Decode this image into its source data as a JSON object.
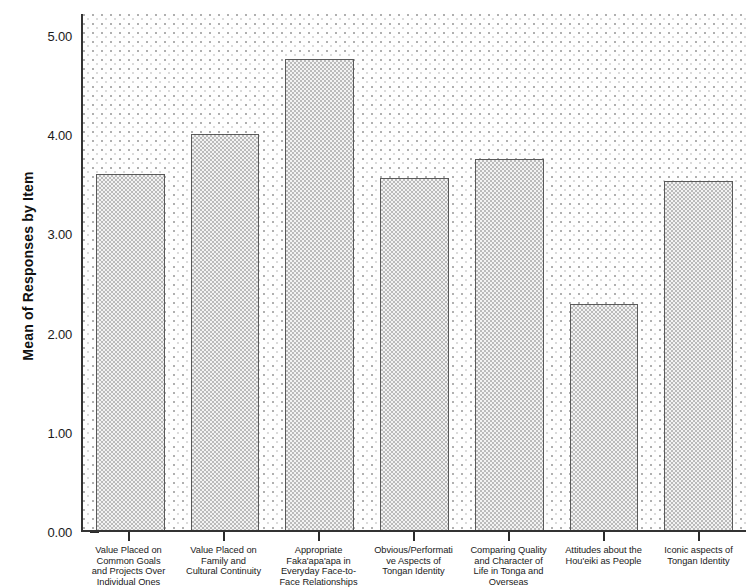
{
  "chart_data": {
    "type": "bar",
    "title": "",
    "subtitle": "",
    "xlabel": "",
    "ylabel": "Mean of Responses by Item",
    "ylim": [
      0.0,
      5.22
    ],
    "yticks": [
      "0.00",
      "1.00",
      "2.00",
      "3.00",
      "4.00",
      "5.00"
    ],
    "ytick_values": [
      0.0,
      1.0,
      2.0,
      3.0,
      4.0,
      5.0
    ],
    "grid": false,
    "legend": null,
    "categories": [
      "Value Placed on Common Goals and Projects Over Individual Ones",
      "Value Placed on Family and Cultural Continuity",
      "Appropriate Faka'apa'apa in Everyday Face-to-Face Relationships",
      "Obvious/Performative Aspects of Tongan Identity",
      "Comparing Quality and Character of Life in Tonga and Overseas",
      "Attitudes about the Hou'eiki as People",
      "Iconic aspects of Tongan Identity"
    ],
    "category_lines": [
      [
        "Value Placed on",
        "Common Goals",
        "and Projects Over",
        "Individual Ones"
      ],
      [
        "Value Placed on",
        "Family and",
        "Cultural Continuity"
      ],
      [
        "Appropriate",
        "Faka'apa'apa in",
        "Everyday Face-to-",
        "Face Relationships"
      ],
      [
        "Obvious/Performati",
        "ve Aspects of",
        "Tongan Identity"
      ],
      [
        "Comparing Quality",
        "and Character of",
        "Life in Tonga and",
        "Overseas"
      ],
      [
        "Attitudes about the",
        "Hou'eiki as People"
      ],
      [
        "Iconic aspects of",
        "Tongan Identity"
      ]
    ],
    "values": [
      3.59,
      3.99,
      4.75,
      3.55,
      3.74,
      2.28,
      3.52
    ],
    "bar_fill_color": "#f3f3f3",
    "bar_border_color": "#5a5a5a",
    "plot_background_color": "#fefefe",
    "axis_color": "#333333"
  }
}
